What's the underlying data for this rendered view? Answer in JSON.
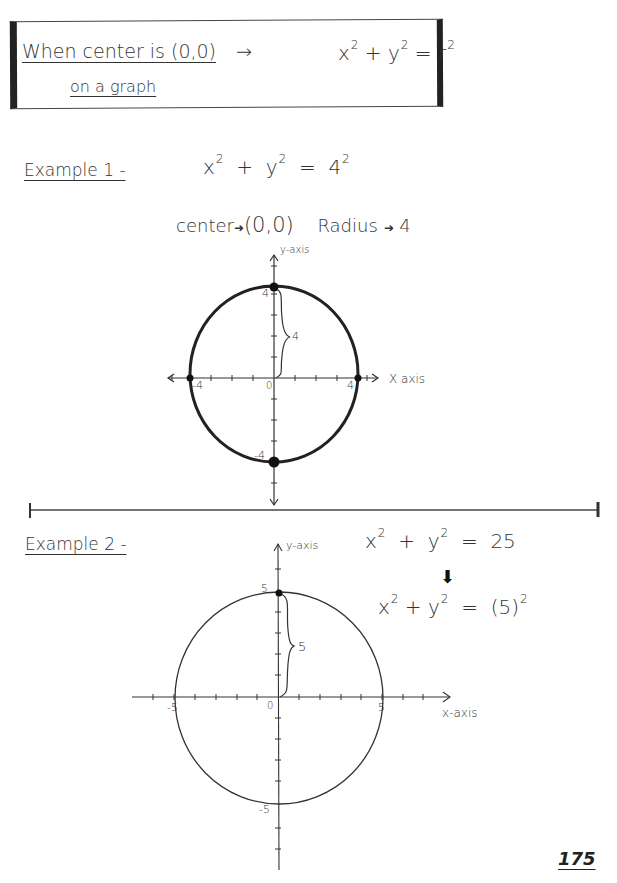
{
  "header_box": {
    "line1": "When center is (0,0)",
    "arrow": "→",
    "formula": {
      "a": "x",
      "b": "y",
      "c": "r",
      "exp": "2",
      "plus": "+",
      "eq": "="
    },
    "line2": "on a graph"
  },
  "example1": {
    "label": "Example 1 -",
    "equation": {
      "a": "x",
      "b": "y",
      "rhs": "4",
      "exp": "2",
      "plus": "+",
      "eq": "="
    },
    "center_label": "center",
    "center_value": "(0,0)",
    "radius_label": "Radius",
    "radius_value": "4",
    "arrow_glyph": "➜",
    "graph": {
      "x_axis_label": "X axis",
      "y_axis_label": "y-axis",
      "origin_label": "0",
      "pos_x": "4",
      "neg_x": "-4",
      "pos_y": "4",
      "neg_y": "-4",
      "brace_label": "4"
    }
  },
  "example2": {
    "label": "Example 2 -",
    "equation": {
      "a": "x",
      "b": "y",
      "rhs": "25",
      "exp": "2",
      "plus": "+",
      "eq": "="
    },
    "down_arrow": "⬇",
    "equation2": {
      "a": "x",
      "b": "y",
      "rhs": "(5)",
      "exp": "2",
      "plus": "+",
      "eq": "="
    },
    "graph": {
      "x_axis_label": "x-axis",
      "y_axis_label": "y-axis",
      "origin_label": "0",
      "pos_x": "5",
      "neg_x": "-5",
      "pos_y": "5",
      "neg_y": "-5",
      "brace_label": "5"
    }
  },
  "page_number": "175"
}
